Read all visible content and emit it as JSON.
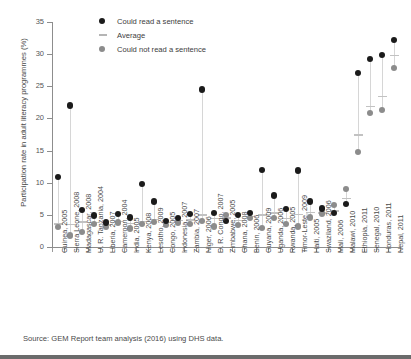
{
  "chart_data": {
    "type": "scatter",
    "title": "",
    "xlabel": "",
    "ylabel": "Participation rate in adult literacy programmes (%)",
    "ylim": [
      0,
      35
    ],
    "yticks": [
      0,
      5,
      10,
      15,
      20,
      25,
      30,
      35
    ],
    "grid": false,
    "legend_position": "top-center",
    "legend": [
      {
        "key": "read",
        "label": "Could read a sentence",
        "marker": "circle",
        "color": "#1b1b1b"
      },
      {
        "key": "average",
        "label": "Average",
        "marker": "dash",
        "color": "#b5b5b5"
      },
      {
        "key": "notread",
        "label": "Could not read a sentence",
        "marker": "circle",
        "color": "#8c8c8c"
      }
    ],
    "categories": [
      "Guinea, 2005",
      "Sierra Leone, 2008",
      "Madagascar, 2008",
      "U. R. Tanzania, 2004",
      "Liberia, 2007",
      "Cameroon, 2004",
      "India, 2005",
      "Kenya, 2008",
      "Lesotho, 2009",
      "Congo, 2005",
      "Indonesia, 2007",
      "Zambia, 2007",
      "Niger, 2006",
      "D. R. Congo, 2007",
      "Zimbabwe, 2005",
      "Ghana, 2008",
      "Benin, 2006",
      "Guyana, 2009",
      "Uganda, 2006",
      "Rwanda, 2005",
      "Timor-Leste, 2009",
      "Haiti, 2005",
      "Swaziland, 2006",
      "Mali, 2006",
      "Malawi, 2010",
      "Ethiopia, 2011",
      "Senegal, 2010",
      "Honduras, 2011",
      "Nepal, 2011"
    ],
    "series": [
      {
        "name": "Could read a sentence",
        "key": "read",
        "color": "#1b1b1b",
        "values": [
          10.9,
          22.0,
          5.8,
          4.9,
          3.8,
          5.1,
          4.6,
          9.8,
          7.1,
          4.0,
          4.5,
          5.1,
          24.5,
          5.3,
          4.0,
          5.0,
          5.3,
          12.0,
          8.0,
          5.9,
          11.9,
          7.1,
          6.0,
          5.3,
          6.7,
          27.1,
          29.2,
          29.9,
          32.2
        ]
      },
      {
        "name": "Average",
        "key": "average",
        "color": "#c2c2c2",
        "values": [
          3.6,
          3.5,
          3.9,
          3.8,
          3.4,
          4.0,
          3.7,
          4.0,
          4.3,
          3.8,
          4.1,
          4.2,
          5.0,
          4.4,
          4.5,
          4.1,
          4.7,
          5.0,
          5.3,
          4.4,
          5.1,
          5.4,
          5.3,
          5.6,
          7.5,
          17.4,
          21.9,
          23.4,
          29.8
        ]
      },
      {
        "name": "Could not read a sentence",
        "key": "notread",
        "color": "#8c8c8c",
        "values": [
          3.1,
          1.8,
          2.3,
          3.6,
          3.1,
          3.8,
          2.9,
          3.6,
          3.9,
          3.4,
          3.8,
          3.6,
          4.0,
          3.2,
          5.0,
          3.4,
          4.5,
          3.0,
          4.5,
          3.6,
          3.2,
          4.6,
          5.2,
          6.5,
          9.0,
          14.8,
          20.8,
          21.3,
          27.8
        ]
      }
    ]
  },
  "source": {
    "note": "Source: GEM Report team analysis (2016) using DHS data."
  }
}
